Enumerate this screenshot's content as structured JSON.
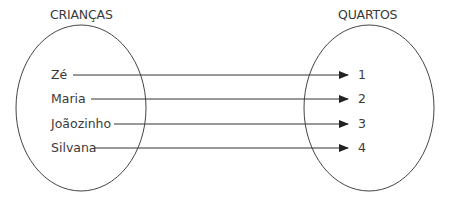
{
  "diagram": {
    "type": "function-mapping",
    "domain_set": {
      "title": "CRIANÇAS",
      "elements": [
        "Zé",
        "Maria",
        "Joãozinho",
        "Silvana"
      ]
    },
    "codomain_set": {
      "title": "QUARTOS",
      "elements": [
        "1",
        "2",
        "3",
        "4"
      ]
    },
    "mappings": [
      {
        "from": "Zé",
        "to": "1"
      },
      {
        "from": "Maria",
        "to": "2"
      },
      {
        "from": "Joãozinho",
        "to": "3"
      },
      {
        "from": "Silvana",
        "to": "4"
      }
    ],
    "colors": {
      "stroke": "#333333",
      "text": "#3a3a3a",
      "background": "#ffffff"
    }
  }
}
